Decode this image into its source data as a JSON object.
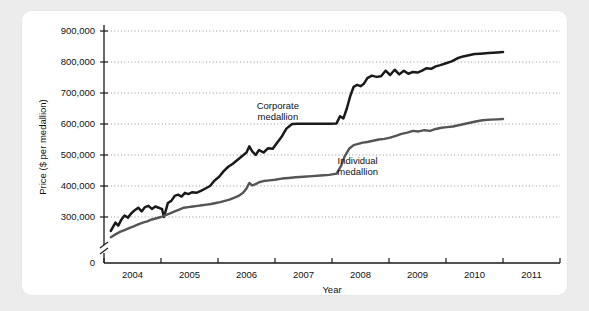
{
  "chart_data": {
    "type": "line",
    "title": "",
    "xlabel": "Year",
    "ylabel": "Price ($ per medallion)",
    "xlim": [
      2003.5,
      2011.5
    ],
    "ylim": [
      0,
      900000
    ],
    "y_axis_break": true,
    "y_break_between": [
      0,
      250000
    ],
    "grid": true,
    "legend_position": "inline-annotations",
    "xticks": [
      2004,
      2005,
      2006,
      2007,
      2008,
      2009,
      2010,
      2011
    ],
    "xtick_labels": [
      "2004",
      "2005",
      "2006",
      "2007",
      "2008",
      "2009",
      "2010",
      "2011"
    ],
    "yticks": [
      0,
      300000,
      400000,
      500000,
      600000,
      700000,
      800000,
      900000
    ],
    "ytick_labels": [
      "0",
      "300,000",
      "400,000",
      "500,000",
      "600,000",
      "700,000",
      "800,000",
      "900,000"
    ],
    "annotations": [
      {
        "text_line1": "Corporate",
        "text_line2": "medallion",
        "x": 2006.55,
        "y": 648000
      },
      {
        "text_line1": "Individual",
        "text_line2": "medallion",
        "x": 2007.95,
        "y": 470000
      }
    ],
    "series": [
      {
        "name": "Corporate medallion",
        "color": "#1a1a1a",
        "x": [
          2003.62,
          2003.7,
          2003.75,
          2003.8,
          2003.86,
          2003.92,
          2003.98,
          2004.04,
          2004.1,
          2004.16,
          2004.22,
          2004.28,
          2004.34,
          2004.4,
          2004.46,
          2004.52,
          2004.55,
          2004.58,
          2004.62,
          2004.68,
          2004.74,
          2004.8,
          2004.86,
          2004.92,
          2004.98,
          2005.05,
          2005.12,
          2005.2,
          2005.28,
          2005.36,
          2005.44,
          2005.52,
          2005.6,
          2005.68,
          2005.76,
          2005.84,
          2005.92,
          2006.0,
          2006.05,
          2006.1,
          2006.16,
          2006.22,
          2006.3,
          2006.38,
          2006.46,
          2006.54,
          2006.62,
          2006.7,
          2006.8,
          2006.9,
          2007.0,
          2007.15,
          2007.3,
          2007.45,
          2007.58,
          2007.64,
          2007.7,
          2007.76,
          2007.82,
          2007.88,
          2007.94,
          2008.0,
          2008.06,
          2008.12,
          2008.2,
          2008.28,
          2008.36,
          2008.44,
          2008.52,
          2008.6,
          2008.68,
          2008.76,
          2008.84,
          2008.92,
          2009.0,
          2009.08,
          2009.16,
          2009.24,
          2009.32,
          2009.4,
          2009.5,
          2009.6,
          2009.7,
          2009.8,
          2009.9,
          2010.0,
          2010.1,
          2010.25,
          2010.4,
          2010.5
        ],
        "y": [
          255000,
          282000,
          272000,
          290000,
          305000,
          298000,
          312000,
          322000,
          330000,
          318000,
          332000,
          336000,
          326000,
          334000,
          330000,
          325000,
          300000,
          318000,
          345000,
          352000,
          368000,
          372000,
          366000,
          378000,
          374000,
          380000,
          378000,
          384000,
          392000,
          400000,
          418000,
          430000,
          448000,
          462000,
          472000,
          484000,
          496000,
          508000,
          528000,
          512000,
          500000,
          516000,
          508000,
          522000,
          520000,
          540000,
          560000,
          585000,
          600000,
          601000,
          601000,
          601000,
          601000,
          601000,
          602000,
          625000,
          618000,
          650000,
          690000,
          720000,
          726000,
          722000,
          730000,
          748000,
          756000,
          752000,
          754000,
          772000,
          758000,
          775000,
          760000,
          772000,
          762000,
          768000,
          766000,
          772000,
          780000,
          778000,
          786000,
          790000,
          796000,
          802000,
          812000,
          818000,
          822000,
          826000,
          827000,
          829000,
          831000,
          832000
        ]
      },
      {
        "name": "Individual medallion",
        "color": "#555555",
        "x": [
          2003.62,
          2003.7,
          2003.78,
          2003.86,
          2003.94,
          2004.02,
          2004.1,
          2004.18,
          2004.26,
          2004.34,
          2004.42,
          2004.5,
          2004.58,
          2004.66,
          2004.74,
          2004.82,
          2004.9,
          2004.98,
          2005.06,
          2005.14,
          2005.22,
          2005.3,
          2005.38,
          2005.46,
          2005.54,
          2005.62,
          2005.7,
          2005.78,
          2005.86,
          2005.94,
          2006.0,
          2006.05,
          2006.1,
          2006.16,
          2006.22,
          2006.3,
          2006.4,
          2006.5,
          2006.62,
          2006.74,
          2006.86,
          2007.0,
          2007.15,
          2007.3,
          2007.45,
          2007.58,
          2007.66,
          2007.72,
          2007.8,
          2007.88,
          2007.96,
          2008.04,
          2008.12,
          2008.22,
          2008.32,
          2008.42,
          2008.52,
          2008.62,
          2008.72,
          2008.82,
          2008.92,
          2009.02,
          2009.12,
          2009.22,
          2009.32,
          2009.42,
          2009.52,
          2009.62,
          2009.72,
          2009.82,
          2009.92,
          2010.02,
          2010.14,
          2010.28,
          2010.4,
          2010.5
        ],
        "y": [
          235000,
          244000,
          252000,
          258000,
          264000,
          270000,
          276000,
          282000,
          286000,
          292000,
          296000,
          300000,
          306000,
          312000,
          318000,
          324000,
          330000,
          332000,
          334000,
          336000,
          338000,
          340000,
          342000,
          345000,
          348000,
          352000,
          356000,
          362000,
          368000,
          378000,
          392000,
          410000,
          402000,
          406000,
          412000,
          416000,
          418000,
          420000,
          424000,
          426000,
          428000,
          430000,
          432000,
          434000,
          436000,
          440000,
          465000,
          495000,
          520000,
          532000,
          536000,
          540000,
          542000,
          546000,
          550000,
          552000,
          556000,
          562000,
          568000,
          572000,
          578000,
          576000,
          580000,
          578000,
          584000,
          588000,
          590000,
          592000,
          596000,
          600000,
          604000,
          608000,
          612000,
          614000,
          615000,
          616000
        ]
      }
    ]
  },
  "watermark": {
    "text": ""
  }
}
